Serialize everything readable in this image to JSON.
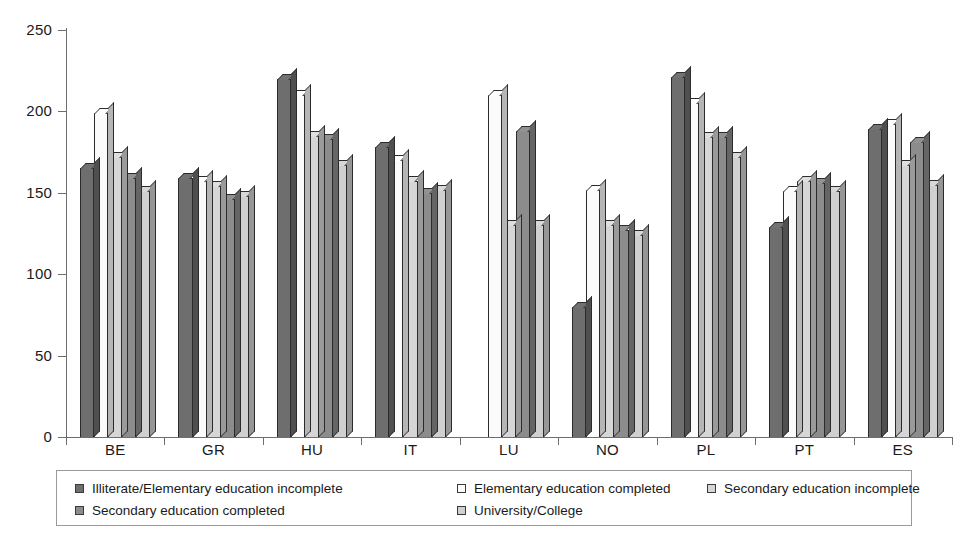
{
  "chart_data": {
    "type": "bar",
    "title": "",
    "subtitle": "",
    "xlabel": "",
    "ylabel": "",
    "ylim": [
      0,
      250
    ],
    "yticks": [
      0,
      50,
      100,
      150,
      200,
      250
    ],
    "grid": false,
    "legend_position": "bottom",
    "categories": [
      "BE",
      "GR",
      "HU",
      "IT",
      "LU",
      "NO",
      "PL",
      "PT",
      "ES"
    ],
    "series": [
      {
        "name": "Illiterate/Elementary education incomplete",
        "color": "#6e6e6e",
        "values": [
          165,
          159,
          220,
          178,
          null,
          80,
          221,
          129,
          189
        ]
      },
      {
        "name": "Elementary education completed",
        "color": "#fbfbfb",
        "values": [
          199,
          157,
          210,
          170,
          210,
          152,
          205,
          151,
          192
        ]
      },
      {
        "name": "Secondary education incomplete",
        "color": "#d6d6d6",
        "values": [
          172,
          154,
          185,
          157,
          130,
          130,
          184,
          157,
          167
        ]
      },
      {
        "name": "Secondary education completed",
        "color": "#8c8c8c",
        "values": [
          159,
          146,
          183,
          150,
          188,
          127,
          184,
          156,
          181
        ]
      },
      {
        "name": "University/College",
        "color": "#d0d0d0",
        "values": [
          151,
          148,
          167,
          152,
          130,
          124,
          172,
          151,
          155
        ]
      }
    ]
  },
  "legend": {
    "entries": [
      "Illiterate/Elementary education incomplete",
      "Elementary education completed",
      "Secondary education incomplete",
      "Secondary education completed",
      "University/College"
    ]
  }
}
